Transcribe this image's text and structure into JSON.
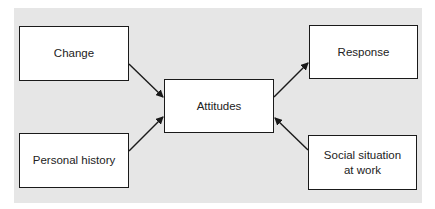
{
  "diagram": {
    "type": "flow",
    "nodes": [
      {
        "id": "change",
        "label": "Change"
      },
      {
        "id": "personal_history",
        "label": "Personal history"
      },
      {
        "id": "attitudes",
        "label": "Attitudes"
      },
      {
        "id": "response",
        "label": "Response"
      },
      {
        "id": "social_situation",
        "label_line1": "Social situation",
        "label_line2": "at work"
      }
    ],
    "edges": [
      {
        "from": "change",
        "to": "attitudes"
      },
      {
        "from": "personal_history",
        "to": "attitudes"
      },
      {
        "from": "attitudes",
        "to": "response"
      },
      {
        "from": "social_situation",
        "to": "attitudes"
      }
    ],
    "colors": {
      "background_panel": "#e6e6e6",
      "box_fill": "#ffffff",
      "stroke": "#1a1a1a"
    }
  }
}
